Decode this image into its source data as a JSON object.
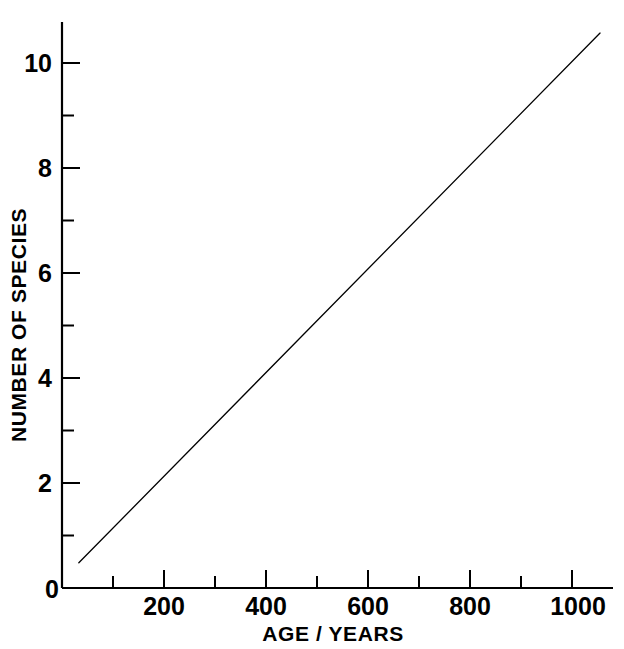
{
  "figure": {
    "background_color": "#ffffff",
    "ink_color": "#000000",
    "top_crop_artifact": "·  ·· ·   ·     ·"
  },
  "chart_data": {
    "type": "line",
    "title": "",
    "subtitle": "",
    "xlabel": "AGE / YEARS",
    "ylabel": "NUMBER OF SPECIES",
    "xlim": [
      0,
      1080
    ],
    "ylim": [
      0,
      10.8
    ],
    "grid": false,
    "legend": null,
    "x_major_ticks": [
      0,
      200,
      400,
      600,
      800,
      1000
    ],
    "x_major_tick_labels": [
      "0",
      "200",
      "400",
      "600",
      "800",
      "1000"
    ],
    "x_minor_ticks": [
      100,
      300,
      500,
      700,
      900
    ],
    "y_major_ticks": [
      0,
      2,
      4,
      6,
      8,
      10
    ],
    "y_major_tick_labels": [
      "0",
      "2",
      "4",
      "6",
      "8",
      "10"
    ],
    "y_minor_ticks": [
      1,
      3,
      5,
      7,
      9
    ],
    "series": [
      {
        "name": "species accumulation",
        "style": "solid-thin-line",
        "color": "#000000",
        "x": [
          33,
          1055
        ],
        "y": [
          0.48,
          10.57
        ]
      }
    ],
    "annotations": []
  },
  "axis_labels": {
    "x_title": "AGE / YEARS",
    "y_title": "NUMBER OF SPECIES"
  },
  "x_tick_text": {
    "t0": "0",
    "t200": "200",
    "t400": "400",
    "t600": "600",
    "t800": "800",
    "t1000": "1000"
  },
  "y_tick_text": {
    "t0": "0",
    "t2": "2",
    "t4": "4",
    "t6": "6",
    "t8": "8",
    "t10": "10"
  }
}
